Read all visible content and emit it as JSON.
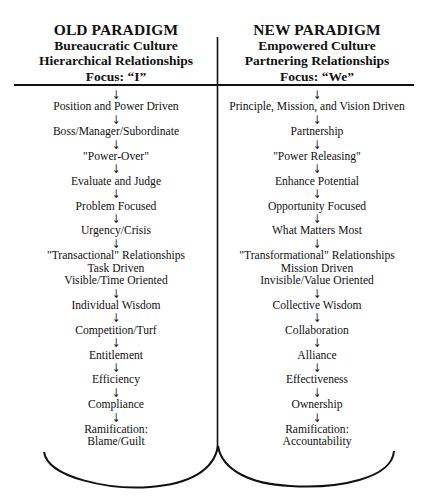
{
  "diagram": {
    "left": {
      "title": "OLD PARADIGM",
      "subtitles": [
        "Bureaucratic Culture",
        "Hierarchical Relationships",
        "Focus:  “I”"
      ],
      "items": [
        {
          "lines": [
            "Position and Power Driven"
          ]
        },
        {
          "lines": [
            "Boss/Manager/Subordinate"
          ]
        },
        {
          "lines": [
            "\"Power-Over\""
          ]
        },
        {
          "lines": [
            "Evaluate and Judge"
          ]
        },
        {
          "lines": [
            "Problem Focused"
          ]
        },
        {
          "lines": [
            "Urgency/Crisis"
          ]
        },
        {
          "lines": [
            "\"Transactional\" Relationships",
            "Task Driven",
            "Visible/Time Oriented"
          ]
        },
        {
          "lines": [
            "Individual Wisdom"
          ]
        },
        {
          "lines": [
            "Competition/Turf"
          ]
        },
        {
          "lines": [
            "Entitlement"
          ]
        },
        {
          "lines": [
            "Efficiency"
          ]
        },
        {
          "lines": [
            "Compliance"
          ]
        },
        {
          "lines": [
            "Ramification:",
            "Blame/Guilt"
          ]
        }
      ]
    },
    "right": {
      "title": "NEW PARADIGM",
      "subtitles": [
        "Empowered Culture",
        "Partnering Relationships",
        "Focus:  “We”"
      ],
      "items": [
        {
          "lines": [
            "Principle, Mission, and Vision Driven"
          ]
        },
        {
          "lines": [
            "Partnership"
          ]
        },
        {
          "lines": [
            "\"Power Releasing\""
          ]
        },
        {
          "lines": [
            "Enhance Potential"
          ]
        },
        {
          "lines": [
            "Opportunity Focused"
          ]
        },
        {
          "lines": [
            "What Matters Most"
          ]
        },
        {
          "lines": [
            "\"Transformational\" Relationships",
            "Mission Driven",
            "Invisible/Value Oriented"
          ]
        },
        {
          "lines": [
            "Collective Wisdom"
          ]
        },
        {
          "lines": [
            "Collaboration"
          ]
        },
        {
          "lines": [
            "Alliance"
          ]
        },
        {
          "lines": [
            "Effectiveness"
          ]
        },
        {
          "lines": [
            "Ownership"
          ]
        },
        {
          "lines": [
            "Ramification:",
            "Accountability"
          ]
        }
      ]
    },
    "arrow_glyph": "↓",
    "colors": {
      "ink": "#111111",
      "background": "#ffffff"
    }
  }
}
